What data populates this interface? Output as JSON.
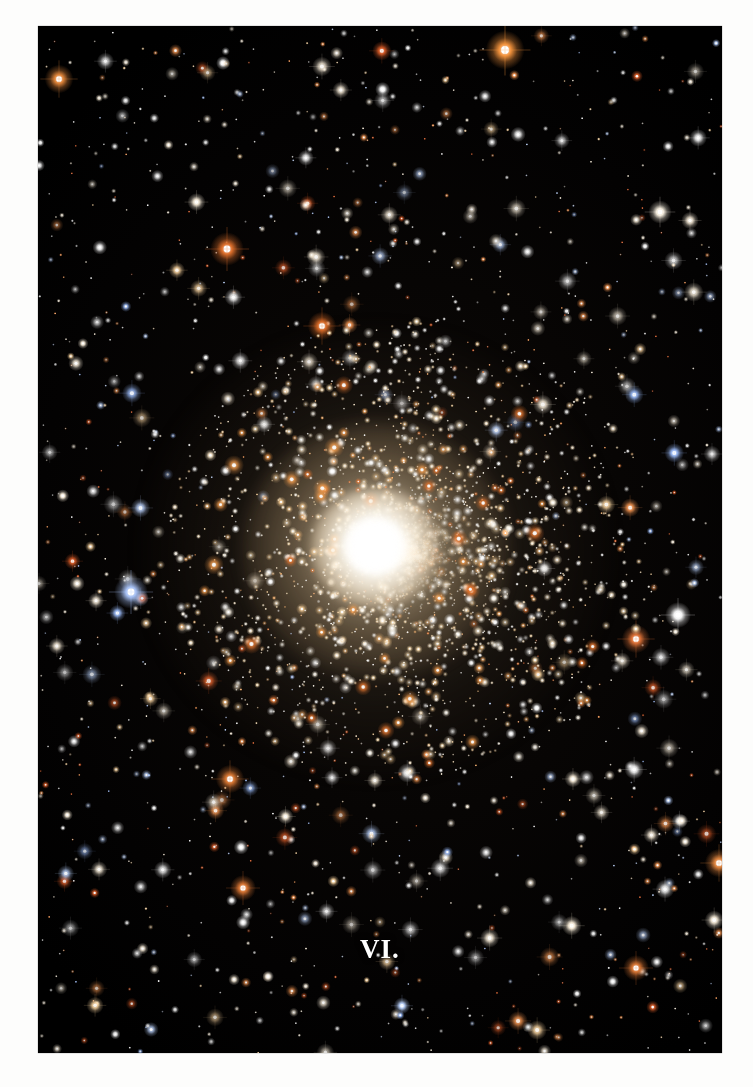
{
  "plate": {
    "caption": "VI.",
    "frame": {
      "left": 38,
      "top": 26,
      "width": 684,
      "height": 1027
    },
    "margin_color": "#fdfdfc",
    "sky_color": "#000000"
  },
  "image_content": {
    "subject": "globular star cluster",
    "description": "Dense globular cluster of several thousand resolved stars with a saturated white unresolved core, surrounded by a warm golden halo and a rich scattered field of white, pale blue and orange foreground stars on a black sky.",
    "cluster": {
      "center_x": 408,
      "center_y": 552,
      "core_radius": 34,
      "halo_radius": 150,
      "outer_radius": 240,
      "core_color": "#ffffff",
      "halo_color": "#d8bc92",
      "resolved_star_count": 3600
    },
    "field": {
      "background_star_count": 1500,
      "star_colors": [
        "#ffffff",
        "#fff3df",
        "#ffd9a4",
        "#ff9c55",
        "#e2602a",
        "#bcd4ff",
        "#9fc0ff"
      ]
    },
    "notable_stars": [
      {
        "name": "bright-orange-star-top",
        "x": 505,
        "y": 50,
        "radius": 7.5,
        "color": "#ff9a40"
      },
      {
        "name": "orange-star-upper-left",
        "x": 227,
        "y": 249,
        "radius": 6.5,
        "color": "#e8752e"
      },
      {
        "name": "orange-star-upper-mid",
        "x": 322,
        "y": 326,
        "radius": 5.5,
        "color": "#e06f2a"
      },
      {
        "name": "blue-star-left",
        "x": 131,
        "y": 592,
        "radius": 6.5,
        "color": "#aec9ff"
      },
      {
        "name": "orange-star-left-edge",
        "x": 59,
        "y": 79,
        "radius": 5.5,
        "color": "#e98a3c"
      },
      {
        "name": "orange-star-right-mid",
        "x": 636,
        "y": 639,
        "radius": 5.5,
        "color": "#e5763a"
      },
      {
        "name": "orange-star-lower-left",
        "x": 230,
        "y": 779,
        "radius": 5.5,
        "color": "#dd7a34"
      },
      {
        "name": "orange-star-lower-right",
        "x": 719,
        "y": 863,
        "radius": 5.5,
        "color": "#e88a42"
      },
      {
        "name": "orange-star-bottom-right",
        "x": 636,
        "y": 968,
        "radius": 5.0,
        "color": "#e07a36"
      },
      {
        "name": "orange-star-bottom-left",
        "x": 243,
        "y": 888,
        "radius": 5.0,
        "color": "#e07a36"
      },
      {
        "name": "white-star-right",
        "x": 678,
        "y": 615,
        "radius": 5.0,
        "color": "#ffffff"
      },
      {
        "name": "white-star-upper-right",
        "x": 660,
        "y": 212,
        "radius": 4.5,
        "color": "#fff6e6"
      }
    ]
  }
}
